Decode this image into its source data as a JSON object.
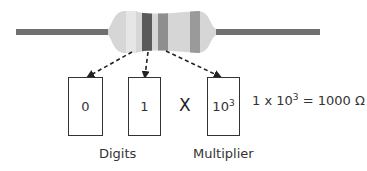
{
  "resistor": {
    "bands": [
      {
        "position": 1,
        "meaning": "digit",
        "value": "0",
        "color": "#e4e4e4"
      },
      {
        "position": 2,
        "meaning": "digit",
        "value": "1",
        "color": "#5a5a5a"
      },
      {
        "position": 3,
        "meaning": "multiplier",
        "value": "10^3",
        "color": "#8e8e8e"
      },
      {
        "position": 4,
        "meaning": "tolerance",
        "color": "#9a9a9a"
      }
    ],
    "body_color": "#d6d6d6",
    "lead_color": "#707070"
  },
  "boxes": {
    "digit1": "0",
    "digit2": "1",
    "multiplier_base": "10",
    "multiplier_exp": "3"
  },
  "operator": "X",
  "equation": {
    "prefix": "1 x 10",
    "exp": "3",
    "suffix": " = 1000 Ω"
  },
  "labels": {
    "digits": "Digits",
    "multiplier": "Multiplier"
  }
}
